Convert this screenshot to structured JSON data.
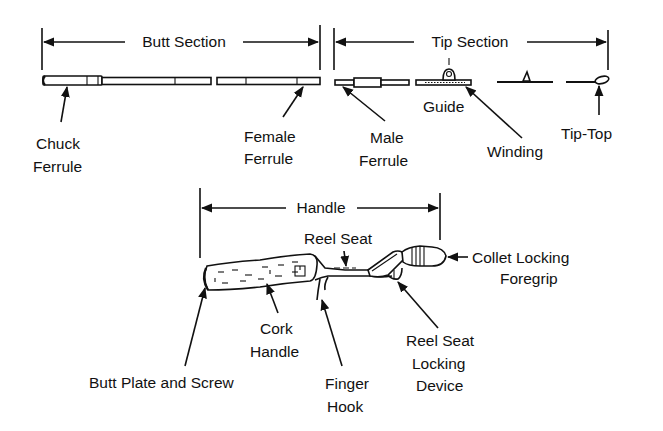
{
  "figure": {
    "colors": {
      "ink": "#111111",
      "background": "#ffffff"
    }
  },
  "sections": {
    "butt": {
      "label": "Butt Section"
    },
    "tip": {
      "label": "Tip Section"
    },
    "handle": {
      "label": "Handle"
    }
  },
  "labels": {
    "chuck_ferrule": {
      "line1": "Chuck",
      "line2": "Ferrule"
    },
    "female_ferrule": {
      "line1": "Female",
      "line2": "Ferrule"
    },
    "male_ferrule": {
      "line1": "Male",
      "line2": "Ferrule"
    },
    "guide": {
      "line1": "Guide"
    },
    "winding": {
      "line1": "Winding"
    },
    "tip_top": {
      "line1": "Tip-Top"
    },
    "reel_seat": {
      "line1": "Reel Seat"
    },
    "collet_locking_foregrip": {
      "line1": "Collet Locking",
      "line2": "Foregrip"
    },
    "cork_handle": {
      "line1": "Cork",
      "line2": "Handle"
    },
    "butt_plate_and_screw": {
      "line1": "Butt Plate and Screw"
    },
    "finger_hook": {
      "line1": "Finger",
      "line2": "Hook"
    },
    "reel_seat_locking_device": {
      "line1": "Reel Seat",
      "line2": "Locking",
      "line3": "Device"
    }
  }
}
